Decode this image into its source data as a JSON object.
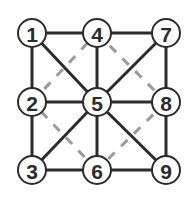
{
  "diagram": {
    "colors": {
      "edge": "#2b2b2b",
      "dashed": "#9a9a9a",
      "node_fill": "#ffffff"
    },
    "nodes": [
      {
        "id": "1",
        "label": "1",
        "x": 32,
        "y": 33
      },
      {
        "id": "2",
        "label": "2",
        "x": 32,
        "y": 102
      },
      {
        "id": "3",
        "label": "3",
        "x": 32,
        "y": 170
      },
      {
        "id": "4",
        "label": "4",
        "x": 97,
        "y": 33
      },
      {
        "id": "5",
        "label": "5",
        "x": 97,
        "y": 102
      },
      {
        "id": "6",
        "label": "6",
        "x": 97,
        "y": 170
      },
      {
        "id": "7",
        "label": "7",
        "x": 166,
        "y": 33
      },
      {
        "id": "8",
        "label": "8",
        "x": 166,
        "y": 102
      },
      {
        "id": "9",
        "label": "9",
        "x": 166,
        "y": 170
      }
    ],
    "solid_edges": [
      [
        "1",
        "4"
      ],
      [
        "4",
        "7"
      ],
      [
        "2",
        "5"
      ],
      [
        "5",
        "8"
      ],
      [
        "3",
        "6"
      ],
      [
        "6",
        "9"
      ],
      [
        "1",
        "2"
      ],
      [
        "2",
        "3"
      ],
      [
        "4",
        "5"
      ],
      [
        "5",
        "6"
      ],
      [
        "7",
        "8"
      ],
      [
        "8",
        "9"
      ],
      [
        "1",
        "5"
      ],
      [
        "5",
        "9"
      ],
      [
        "7",
        "5"
      ],
      [
        "5",
        "3"
      ]
    ],
    "dashed_edges": [
      [
        "4",
        "8"
      ],
      [
        "8",
        "6"
      ],
      [
        "6",
        "2"
      ],
      [
        "2",
        "4"
      ]
    ]
  }
}
